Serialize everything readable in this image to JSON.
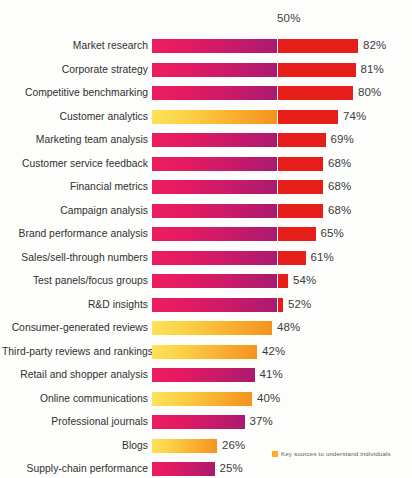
{
  "chart_data": {
    "type": "bar",
    "title": "",
    "subtitle": "",
    "xlabel": "",
    "ylabel": "",
    "orientation": "horizontal",
    "xlim": [
      0,
      90
    ],
    "grid": false,
    "gridline_label": "50%",
    "gridline_value": 50,
    "legend_position": "bottom-right",
    "legend": [
      {
        "label": "Key sources to understand individuals",
        "color": "#f9ad2a"
      }
    ],
    "colors": {
      "pink_start": "#ec1e5e",
      "pink_end": "#a81a70",
      "yellow_start": "#fde35c",
      "yellow_end": "#f4911d",
      "red": "#e61d19",
      "text": "#3b3b3b"
    },
    "categories": [
      "Market research",
      "Corporate strategy",
      "Competitive benchmarking",
      "Customer analytics",
      "Marketing team analysis",
      "Customer service feedback",
      "Financial metrics",
      "Campaign analysis",
      "Brand performance analysis",
      "Sales/sell-through numbers",
      "Test panels/focus groups",
      "R&D insights",
      "Consumer-generated reviews",
      "Third-party reviews and rankings",
      "Retail and shopper analysis",
      "Online communications",
      "Professional journals",
      "Blogs",
      "Supply-chain performance"
    ],
    "values": [
      82,
      81,
      80,
      74,
      69,
      68,
      68,
      68,
      65,
      61,
      54,
      52,
      48,
      42,
      41,
      40,
      37,
      26,
      25
    ],
    "value_labels": [
      "82%",
      "81%",
      "80%",
      "74%",
      "69%",
      "68%",
      "68%",
      "68%",
      "65%",
      "61%",
      "54%",
      "52%",
      "48%",
      "42%",
      "41%",
      "40%",
      "37%",
      "26%",
      "25%"
    ],
    "series_type": [
      "internal",
      "internal",
      "internal",
      "key-source",
      "internal",
      "internal",
      "internal",
      "internal",
      "internal",
      "internal",
      "internal",
      "internal",
      "key-source",
      "key-source",
      "internal",
      "key-source",
      "internal",
      "key-source",
      "internal"
    ]
  }
}
